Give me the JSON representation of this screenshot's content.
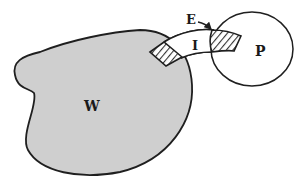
{
  "diagram": {
    "type": "set-topology-sketch",
    "colors": {
      "region_fill": "#cfcfcf",
      "stroke": "#1f1f1f",
      "hatch": "#333333",
      "background": "#ffffff"
    },
    "labels": {
      "W": "W",
      "P": "P",
      "I": "I",
      "E": "E"
    },
    "regions": [
      {
        "id": "W",
        "shape": "kidney-blob",
        "fill": "gray"
      },
      {
        "id": "P",
        "shape": "ellipse",
        "fill": "none"
      },
      {
        "id": "I",
        "shape": "curved-band connecting W and P"
      },
      {
        "id": "W-patch",
        "shape": "hatched quadrilateral at W boundary"
      },
      {
        "id": "E",
        "shape": "hatched quadrilateral at P boundary",
        "pointer": "arrow"
      }
    ]
  }
}
